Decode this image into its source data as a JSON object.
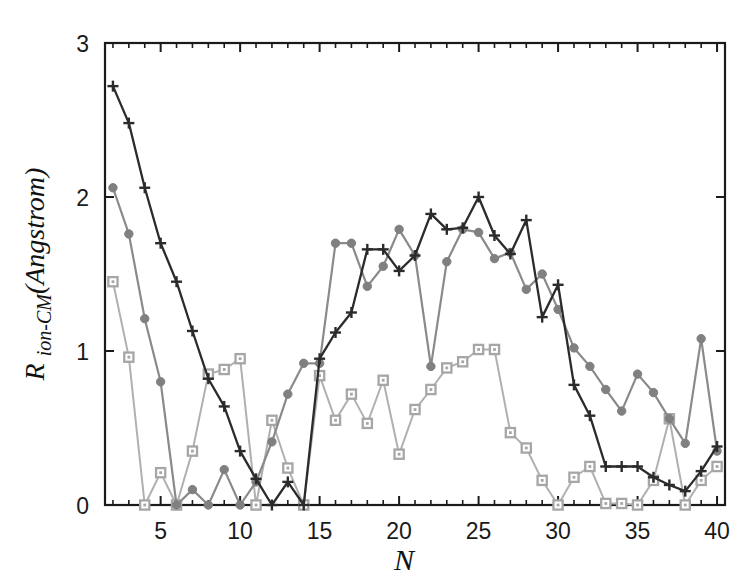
{
  "figure": {
    "background_color": "#ffffff",
    "frame_color": "#1a1a1a",
    "title": ""
  },
  "axes": {
    "x_label": "N",
    "y_label_parts": {
      "main": "R",
      "subscript": "ion-CM",
      "unit": "(Angstrom)"
    },
    "y_label_text": "R ion-CM(Angstrom)",
    "x_tick_labels": [
      "5",
      "10",
      "15",
      "20",
      "25",
      "30",
      "35",
      "40"
    ],
    "y_tick_labels": [
      "0",
      "1",
      "2",
      "3"
    ]
  },
  "chart_data": {
    "type": "line",
    "title": "",
    "xlabel": "N",
    "ylabel": "R_ion-CM (Angstrom)",
    "xlim": [
      1.5,
      40.5
    ],
    "ylim": [
      0,
      3
    ],
    "xticks": [
      5,
      10,
      15,
      20,
      25,
      30,
      35,
      40
    ],
    "yticks": [
      0,
      1,
      2,
      3
    ],
    "minor_ticks": true,
    "grid": false,
    "legend": "none",
    "x": [
      2,
      3,
      4,
      5,
      6,
      7,
      8,
      9,
      10,
      11,
      12,
      13,
      14,
      15,
      16,
      17,
      18,
      19,
      20,
      21,
      22,
      23,
      24,
      25,
      26,
      27,
      28,
      29,
      30,
      31,
      32,
      33,
      34,
      35,
      36,
      37,
      38,
      39,
      40
    ],
    "series": [
      {
        "name": "series-dark-plus",
        "marker": "plus",
        "color": "#2b2b2b",
        "line_color": "#2b2b2b",
        "line_width": 2.3,
        "values": [
          2.72,
          2.48,
          2.06,
          1.7,
          1.45,
          1.13,
          0.82,
          0.64,
          0.35,
          0.17,
          0.0,
          0.15,
          0.0,
          0.95,
          1.12,
          1.25,
          1.66,
          1.66,
          1.52,
          1.62,
          1.89,
          1.79,
          1.8,
          2.0,
          1.75,
          1.63,
          1.85,
          1.22,
          1.43,
          0.78,
          0.58,
          0.25,
          0.25,
          0.25,
          0.18,
          0.13,
          0.09,
          0.22,
          0.38
        ]
      },
      {
        "name": "series-mid-circle",
        "marker": "circle-filled",
        "color": "#808080",
        "line_color": "#8a8a8a",
        "line_width": 2.2,
        "values": [
          2.06,
          1.76,
          1.21,
          0.8,
          0.0,
          0.1,
          0.0,
          0.23,
          0.0,
          0.15,
          0.41,
          0.72,
          0.92,
          0.92,
          1.7,
          1.7,
          1.42,
          1.55,
          1.79,
          1.62,
          0.9,
          1.58,
          1.79,
          1.77,
          1.6,
          1.64,
          1.4,
          1.5,
          1.27,
          1.02,
          0.9,
          0.75,
          0.61,
          0.85,
          0.73,
          0.56,
          0.4,
          1.08,
          0.35
        ]
      },
      {
        "name": "series-light-square",
        "marker": "square-open",
        "color": "#a6a6a6",
        "line_color": "#b0b0b0",
        "line_width": 2.0,
        "values": [
          1.45,
          0.96,
          0.0,
          0.21,
          0.0,
          0.35,
          0.85,
          0.88,
          0.95,
          0.0,
          0.55,
          0.24,
          0.0,
          0.84,
          0.55,
          0.72,
          0.53,
          0.81,
          0.33,
          0.62,
          0.75,
          0.89,
          0.93,
          1.01,
          1.01,
          0.47,
          0.37,
          0.16,
          0.0,
          0.18,
          0.25,
          0.01,
          0.01,
          0.0,
          0.16,
          0.56,
          0.0,
          0.16,
          0.25
        ]
      }
    ]
  }
}
